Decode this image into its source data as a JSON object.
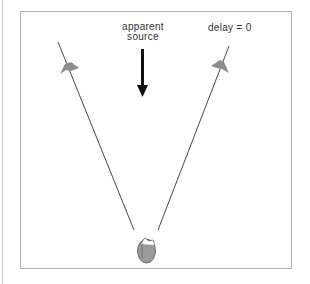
{
  "diagram": {
    "labels": {
      "apparent_source_line1": "apparent",
      "apparent_source_line2": "source",
      "delay": "delay = 0"
    },
    "elements": {
      "left_speaker": "speaker-left",
      "right_speaker": "speaker-right",
      "listener": "listener-head",
      "arrow": "apparent-source-arrow"
    },
    "colors": {
      "line": "#333333",
      "speaker": "#8c8c8c",
      "head_fill": "#9a9a9a",
      "head_stroke": "#555555",
      "frame": "#b4b4b4",
      "arrow": "#111111"
    }
  }
}
